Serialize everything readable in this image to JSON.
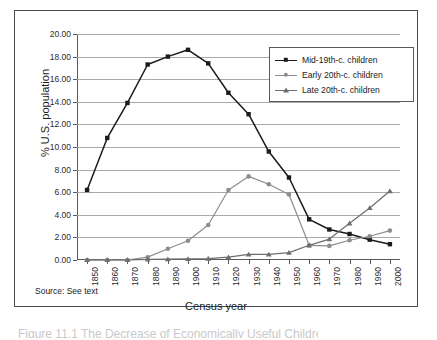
{
  "figure": {
    "source_note": "Source: See text",
    "caption_partial": "Figure 11.1  The Decrease of Economically Useful Children"
  },
  "chart_data": {
    "type": "line",
    "title": "",
    "xlabel": "Census year",
    "ylabel": "% U.S. population",
    "categories": [
      "1850",
      "1860",
      "1870",
      "1880",
      "1890",
      "1900",
      "1910",
      "1920",
      "1930",
      "1940",
      "1950",
      "1960",
      "1970",
      "1980",
      "1990",
      "2000"
    ],
    "ylim": [
      0,
      20
    ],
    "ytick_labels": [
      "0.00",
      "2.00",
      "4.00",
      "6.00",
      "8.00",
      "10.00",
      "12.00",
      "14.00",
      "16.00",
      "18.00",
      "20.00"
    ],
    "ytick_values": [
      0,
      2,
      4,
      6,
      8,
      10,
      12,
      14,
      16,
      18,
      20
    ],
    "grid": "horizontal",
    "legend_position": "top-right",
    "series": [
      {
        "name": "Mid-19th-c. children",
        "color": "#1b1b1b",
        "marker": "square",
        "values": [
          6.2,
          10.8,
          13.9,
          17.3,
          18.0,
          18.6,
          17.4,
          14.8,
          12.9,
          9.6,
          7.3,
          3.6,
          2.7,
          2.3,
          1.8,
          1.4
        ]
      },
      {
        "name": "Early 20th-c. children",
        "color": "#8d8d8d",
        "marker": "circle",
        "values": [
          0.0,
          0.0,
          0.0,
          0.25,
          1.0,
          1.7,
          3.1,
          6.2,
          7.4,
          6.7,
          5.8,
          1.3,
          1.25,
          1.75,
          2.1,
          2.6
        ]
      },
      {
        "name": "Late 20th-c. children",
        "color": "#6e6e6e",
        "marker": "triangle",
        "values": [
          0.0,
          0.0,
          0.0,
          0.05,
          0.07,
          0.1,
          0.13,
          0.25,
          0.5,
          0.5,
          0.65,
          1.3,
          1.85,
          3.25,
          4.6,
          6.1
        ]
      }
    ]
  }
}
